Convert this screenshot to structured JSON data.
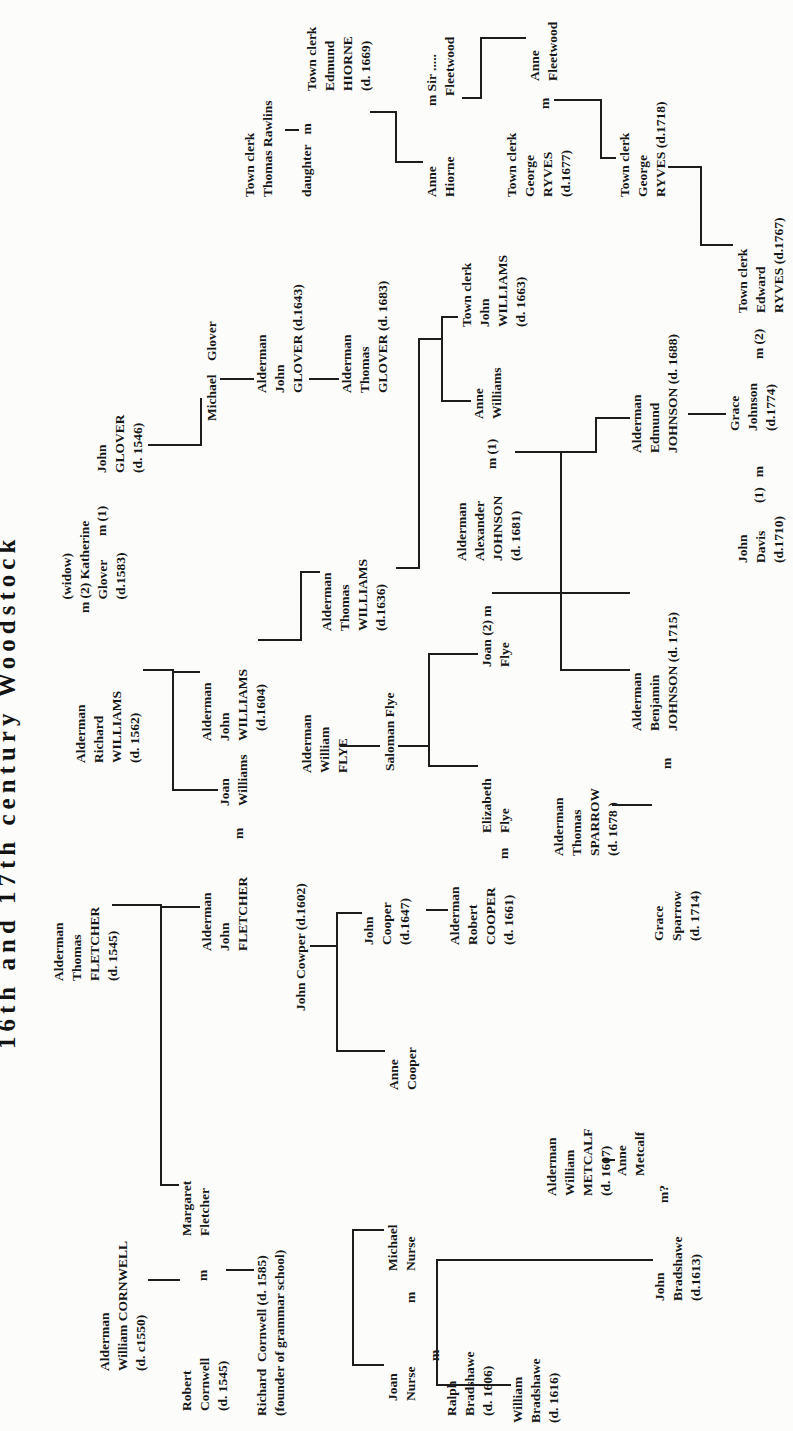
{
  "title": "16th and 17th century Woodstock",
  "accent_color": "#1d1d1d",
  "paper_color": "#fcfcfb",
  "people": [
    {
      "id": "william-cornwell",
      "x": 60,
      "y": 96,
      "lines": [
        "Alderman",
        "William CORNWELL",
        "(d. c1550)"
      ]
    },
    {
      "id": "thomas-fletcher",
      "x": 450,
      "y": 50,
      "lines": [
        "Alderman",
        "Thomas",
        "FLETCHER",
        "(d. 1545)"
      ]
    },
    {
      "id": "richard-williams",
      "x": 668,
      "y": 72,
      "lines": [
        "Alderman",
        "Richard",
        "WILLIAMS",
        "(d. 1562)"
      ]
    },
    {
      "id": "katherine-glover",
      "x": 818,
      "y": 58,
      "lines": [
        "    (widow)",
        "m (2) Katherine",
        "    Glover",
        "    (d.1583)"
      ]
    },
    {
      "id": "m1-glover",
      "x": 895,
      "y": 93,
      "lines": [
        "m (1)"
      ]
    },
    {
      "id": "john-glover-1546",
      "x": 958,
      "y": 93,
      "lines": [
        "John",
        "GLOVER",
        "(d. 1546)"
      ]
    },
    {
      "id": "robert-cornwell",
      "x": 20,
      "y": 178,
      "lines": [
        "Robert",
        "Cornwell",
        "(d. 1545)"
      ]
    },
    {
      "id": "m-robert-margaret",
      "x": 150,
      "y": 194,
      "lines": [
        "m"
      ]
    },
    {
      "id": "margaret-fletcher",
      "x": 195,
      "y": 178,
      "lines": [
        "Margaret",
        "Fletcher"
      ]
    },
    {
      "id": "john-fletcher",
      "x": 480,
      "y": 198,
      "lines": [
        "Alderman",
        "John",
        "FLETCHER"
      ]
    },
    {
      "id": "m-fletcher-joan",
      "x": 592,
      "y": 230,
      "lines": [
        "m"
      ]
    },
    {
      "id": "joan-williams",
      "x": 625,
      "y": 216,
      "lines": [
        "Joan",
        "Williams"
      ]
    },
    {
      "id": "john-williams-1604",
      "x": 690,
      "y": 198,
      "lines": [
        "Alderman",
        "John",
        "WILLIAMS",
        "   (d.1604)"
      ]
    },
    {
      "id": "michael-glover",
      "x": 1010,
      "y": 203,
      "lines": [
        "Michael    Glover"
      ]
    },
    {
      "id": "richard-cornwell",
      "x": 15,
      "y": 253,
      "lines": [
        "Richard  Cornwell (d. 1585)",
        "(founder of grammar school)"
      ]
    },
    {
      "id": "john-cowper",
      "x": 420,
      "y": 292,
      "lines": [
        "John Cowper (d.1602)"
      ]
    },
    {
      "id": "john-glover-1643",
      "x": 1038,
      "y": 253,
      "lines": [
        "Alderman",
        "John",
        "GLOVER (d.1643)"
      ]
    },
    {
      "id": "thomas-glover-1683",
      "x": 1038,
      "y": 338,
      "lines": [
        "Alderman",
        "Thomas",
        "GLOVER (d. 1683)"
      ]
    },
    {
      "id": "thomas-williams-1636",
      "x": 800,
      "y": 318,
      "lines": [
        "Alderman",
        "Thomas",
        "WILLIAMS",
        "(d.1636)"
      ]
    },
    {
      "id": "william-flye",
      "x": 658,
      "y": 298,
      "lines": [
        "Alderman",
        "William",
        "FLYE"
      ]
    },
    {
      "id": "saloman-flye",
      "x": 660,
      "y": 381,
      "lines": [
        "Saloman Flye"
      ]
    },
    {
      "id": "joan-nurse",
      "x": 30,
      "y": 384,
      "lines": [
        "Joan",
        "Nurse"
      ]
    },
    {
      "id": "m-joan-michael",
      "x": 128,
      "y": 402,
      "lines": [
        "m"
      ]
    },
    {
      "id": "michael-nurse",
      "x": 160,
      "y": 384,
      "lines": [
        "Michael",
        "Nurse"
      ]
    },
    {
      "id": "m-joan-ralph",
      "x": 70,
      "y": 426,
      "lines": [
        "m"
      ]
    },
    {
      "id": "ralph-bradshawe",
      "x": 15,
      "y": 443,
      "lines": [
        "Ralph",
        "Bradshawe",
        "(d. 1606)"
      ]
    },
    {
      "id": "william-bradshawe",
      "x": 8,
      "y": 509,
      "lines": [
        "William",
        "Bradshawe",
        "(d. 1616)"
      ]
    },
    {
      "id": "john-bradshawe",
      "x": 130,
      "y": 651,
      "lines": [
        "John",
        "Bradshawe",
        "(d.1613)"
      ]
    },
    {
      "id": "m-john-anne",
      "x": 228,
      "y": 655,
      "lines": [
        "m?"
      ]
    },
    {
      "id": "william-metcalf",
      "x": 235,
      "y": 543,
      "lines": [
        "Alderman",
        "William",
        "METCALF",
        "(d. 1607)"
      ]
    },
    {
      "id": "anne-metcalf",
      "x": 255,
      "y": 613,
      "lines": [
        "Anne",
        "Metcalf"
      ]
    },
    {
      "id": "john-cooper-1647",
      "x": 486,
      "y": 360,
      "lines": [
        "John",
        "Cooper",
        "(d.1647)"
      ]
    },
    {
      "id": "anne-cooper",
      "x": 341,
      "y": 385,
      "lines": [
        "Anne",
        "Cooper"
      ]
    },
    {
      "id": "robert-cooper",
      "x": 486,
      "y": 446,
      "lines": [
        "Alderman",
        "Robert",
        "COOPER",
        "(d. 1661)"
      ]
    },
    {
      "id": "m-cooper-elizabeth",
      "x": 572,
      "y": 495,
      "lines": [
        "m"
      ]
    },
    {
      "id": "elizabeth-flye",
      "x": 598,
      "y": 478,
      "lines": [
        "Elizabeth",
        "Flye"
      ]
    },
    {
      "id": "joan-flye",
      "x": 764,
      "y": 478,
      "lines": [
        "Joan (2) m",
        "Flye"
      ]
    },
    {
      "id": "thomas-sparrow",
      "x": 575,
      "y": 550,
      "lines": [
        "Alderman",
        "Thomas",
        "SPARROW",
        "(d. 1678 )"
      ]
    },
    {
      "id": "grace-sparrow",
      "x": 490,
      "y": 650,
      "lines": [
        "Grace",
        "Sparrow",
        "(d. 1714)"
      ]
    },
    {
      "id": "m-grace-benjamin",
      "x": 662,
      "y": 658,
      "lines": [
        "m"
      ]
    },
    {
      "id": "benjamin-johnson",
      "x": 700,
      "y": 628,
      "lines": [
        "Alderman",
        "Benjamin",
        "JOHNSON (d. 1715)"
      ]
    },
    {
      "id": "alexander-johnson",
      "x": 870,
      "y": 453,
      "lines": [
        "Alderman",
        "Alexander",
        "JOHNSON",
        "(d. 1681)"
      ]
    },
    {
      "id": "m1-anne-williams",
      "x": 962,
      "y": 483,
      "lines": [
        "m (1)"
      ]
    },
    {
      "id": "anne-williams",
      "x": 1012,
      "y": 470,
      "lines": [
        "Anne",
        "Williams"
      ]
    },
    {
      "id": "john-williams-1663",
      "x": 1104,
      "y": 458,
      "lines": [
        "Town clerk",
        "John",
        "WILLIAMS",
        "(d. 1663)"
      ]
    },
    {
      "id": "edmund-johnson",
      "x": 978,
      "y": 628,
      "lines": [
        "Alderman",
        "Edmund",
        "JOHNSON (d. 1688)"
      ]
    },
    {
      "id": "grace-johnson",
      "x": 1000,
      "y": 726,
      "lines": [
        "Grace",
        "Johnson",
        "(d.1774)"
      ]
    },
    {
      "id": "m1-grace-davis",
      "x": 928,
      "y": 750,
      "lines": [
        "(1)   m"
      ]
    },
    {
      "id": "m2-grace-ryves",
      "x": 1072,
      "y": 750,
      "lines": [
        "m (2)"
      ]
    },
    {
      "id": "john-davis",
      "x": 868,
      "y": 734,
      "lines": [
        "John",
        "Davis",
        "(d.1710)"
      ]
    },
    {
      "id": "edward-ryves",
      "x": 1118,
      "y": 734,
      "lines": [
        "Town clerk",
        "Edward",
        "RYVES (d.1767)"
      ]
    },
    {
      "id": "thomas-rawlins",
      "x": 1234,
      "y": 241,
      "lines": [
        "Town clerk",
        "Thomas Rawlins"
      ]
    },
    {
      "id": "daughter-m",
      "x": 1234,
      "y": 298,
      "lines": [
        "daughter   m"
      ]
    },
    {
      "id": "edmund-hiorne",
      "x": 1340,
      "y": 303,
      "lines": [
        "Town clerk",
        "Edmund",
        "HIORNE",
        "(d. 1669)"
      ]
    },
    {
      "id": "anne-hiorne",
      "x": 1234,
      "y": 423,
      "lines": [
        "Anne",
        "Hiorne"
      ]
    },
    {
      "id": "sir-fleetwood",
      "x": 1325,
      "y": 423,
      "lines": [
        "m Sir .....",
        "   Fleetwood"
      ]
    },
    {
      "id": "anne-fleetwood",
      "x": 1350,
      "y": 526,
      "lines": [
        "Anne",
        "Fleetwood"
      ]
    },
    {
      "id": "george-ryves-1677",
      "x": 1234,
      "y": 503,
      "lines": [
        "Town clerk",
        "George",
        "RYVES",
        "(d.1677)"
      ]
    },
    {
      "id": "m-ryves-fleetwood",
      "x": 1322,
      "y": 536,
      "lines": [
        "m"
      ]
    },
    {
      "id": "george-ryves-1718",
      "x": 1234,
      "y": 616,
      "lines": [
        "Town clerk",
        "George",
        "RYVES (d.1718)"
      ]
    }
  ],
  "connectors": [
    {
      "x": 150,
      "y": 148,
      "w": 2,
      "h": 32
    },
    {
      "x": 245,
      "y": 160,
      "w": 282,
      "h": 2
    },
    {
      "x": 525,
      "y": 112,
      "w": 2,
      "h": 50
    },
    {
      "x": 245,
      "y": 160,
      "w": 2,
      "h": 19
    },
    {
      "x": 523,
      "y": 160,
      "w": 2,
      "h": 40
    },
    {
      "x": 160,
      "y": 226,
      "w": 2,
      "h": 28
    },
    {
      "x": 640,
      "y": 172,
      "w": 122,
      "h": 2
    },
    {
      "x": 760,
      "y": 143,
      "w": 2,
      "h": 31
    },
    {
      "x": 640,
      "y": 172,
      "w": 2,
      "h": 46
    },
    {
      "x": 758,
      "y": 172,
      "w": 2,
      "h": 28
    },
    {
      "x": 790,
      "y": 258,
      "w": 2,
      "h": 44
    },
    {
      "x": 790,
      "y": 300,
      "w": 70,
      "h": 2
    },
    {
      "x": 858,
      "y": 300,
      "w": 2,
      "h": 20
    },
    {
      "x": 985,
      "y": 148,
      "w": 2,
      "h": 54
    },
    {
      "x": 985,
      "y": 200,
      "w": 48,
      "h": 2
    },
    {
      "x": 1051,
      "y": 220,
      "w": 2,
      "h": 34
    },
    {
      "x": 1051,
      "y": 309,
      "w": 2,
      "h": 30
    },
    {
      "x": 862,
      "y": 396,
      "w": 2,
      "h": 24
    },
    {
      "x": 862,
      "y": 418,
      "w": 231,
      "h": 2
    },
    {
      "x": 1091,
      "y": 418,
      "w": 2,
      "h": 25
    },
    {
      "x": 1029,
      "y": 441,
      "w": 86,
      "h": 2
    },
    {
      "x": 1029,
      "y": 441,
      "w": 2,
      "h": 30
    },
    {
      "x": 1113,
      "y": 441,
      "w": 2,
      "h": 17
    },
    {
      "x": 978,
      "y": 515,
      "w": 2,
      "h": 82
    },
    {
      "x": 978,
      "y": 595,
      "w": 36,
      "h": 2
    },
    {
      "x": 1012,
      "y": 595,
      "w": 2,
      "h": 35
    },
    {
      "x": 760,
      "y": 560,
      "w": 220,
      "h": 2
    },
    {
      "x": 760,
      "y": 560,
      "w": 2,
      "h": 70
    },
    {
      "x": 837,
      "y": 492,
      "w": 2,
      "h": 138
    },
    {
      "x": 625,
      "y": 612,
      "w": 2,
      "h": 40
    },
    {
      "x": 484,
      "y": 310,
      "w": 2,
      "h": 28
    },
    {
      "x": 379,
      "y": 336,
      "w": 140,
      "h": 2
    },
    {
      "x": 379,
      "y": 336,
      "w": 2,
      "h": 49
    },
    {
      "x": 517,
      "y": 336,
      "w": 2,
      "h": 26
    },
    {
      "x": 520,
      "y": 426,
      "w": 2,
      "h": 22
    },
    {
      "x": 65,
      "y": 352,
      "w": 137,
      "h": 2
    },
    {
      "x": 65,
      "y": 352,
      "w": 2,
      "h": 32
    },
    {
      "x": 200,
      "y": 352,
      "w": 2,
      "h": 32
    },
    {
      "x": 45,
      "y": 436,
      "w": 127,
      "h": 2
    },
    {
      "x": 45,
      "y": 436,
      "w": 2,
      "h": 75
    },
    {
      "x": 170,
      "y": 436,
      "w": 2,
      "h": 217
    },
    {
      "x": 270,
      "y": 602,
      "w": 2,
      "h": 13
    },
    {
      "x": 1300,
      "y": 285,
      "w": 2,
      "h": 14
    },
    {
      "x": 1318,
      "y": 370,
      "w": 2,
      "h": 27
    },
    {
      "x": 1268,
      "y": 395,
      "w": 52,
      "h": 2
    },
    {
      "x": 1268,
      "y": 395,
      "w": 2,
      "h": 28
    },
    {
      "x": 1332,
      "y": 462,
      "w": 2,
      "h": 18
    },
    {
      "x": 1332,
      "y": 480,
      "w": 62,
      "h": 2
    },
    {
      "x": 1392,
      "y": 480,
      "w": 2,
      "h": 46
    },
    {
      "x": 1330,
      "y": 554,
      "w": 2,
      "h": 46
    },
    {
      "x": 1272,
      "y": 600,
      "w": 60,
      "h": 2
    },
    {
      "x": 1272,
      "y": 600,
      "w": 2,
      "h": 16
    },
    {
      "x": 1263,
      "y": 668,
      "w": 2,
      "h": 32
    },
    {
      "x": 1185,
      "y": 700,
      "w": 80,
      "h": 2
    },
    {
      "x": 1185,
      "y": 700,
      "w": 2,
      "h": 33
    },
    {
      "x": 1016,
      "y": 688,
      "w": 2,
      "h": 38
    },
    {
      "x": 684,
      "y": 340,
      "w": 2,
      "h": 40
    },
    {
      "x": 684,
      "y": 398,
      "w": 2,
      "h": 30
    },
    {
      "x": 664,
      "y": 428,
      "w": 114,
      "h": 2
    },
    {
      "x": 664,
      "y": 428,
      "w": 2,
      "h": 50
    },
    {
      "x": 776,
      "y": 428,
      "w": 2,
      "h": 50
    }
  ]
}
